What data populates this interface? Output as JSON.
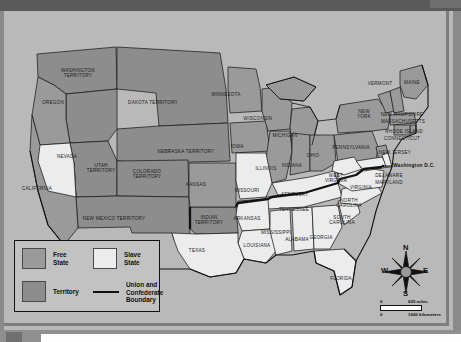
{
  "window": {
    "chrome_color": "#5a5a5a",
    "canvas_color": "#b9b9b9"
  },
  "map": {
    "title": "United States 1861 Free States Slave States and Territories",
    "colors": {
      "free_state": "#9a9a9a",
      "slave_state": "#ececec",
      "territory": "#8d8d8d",
      "boundary": "#111111",
      "outline": "#1b1b1b",
      "background": "#b9b9b9"
    },
    "regions": [
      {
        "name": "WASHINGTON TERRITORY",
        "lines": [
          "WASHINGTON",
          "TERRITORY"
        ],
        "x": 74,
        "y": 62,
        "fill": "territory"
      },
      {
        "name": "OREGON",
        "lines": [
          "OREGON"
        ],
        "x": 49,
        "y": 92,
        "fill": "free_state"
      },
      {
        "name": "DAKOTA TERRITORY",
        "lines": [
          "DAKOTA TERRITORY"
        ],
        "x": 149,
        "y": 92,
        "fill": "territory"
      },
      {
        "name": "MINNESOTA",
        "lines": [
          "MINNESOTA"
        ],
        "x": 222,
        "y": 84,
        "fill": "free_state"
      },
      {
        "name": "WISCONSIN",
        "lines": [
          "WISCONSIN"
        ],
        "x": 254,
        "y": 108,
        "fill": "free_state"
      },
      {
        "name": "MICHIGAN",
        "lines": [
          "MICHIGAN"
        ],
        "x": 281,
        "y": 125,
        "fill": "free_state"
      },
      {
        "name": "VERMONT",
        "lines": [
          "VERMONT"
        ],
        "x": 376,
        "y": 73,
        "fill": "free_state"
      },
      {
        "name": "MAINE",
        "lines": [
          "MAINE"
        ],
        "x": 408,
        "y": 72,
        "fill": "free_state"
      },
      {
        "name": "NEW HAMPSHIRE",
        "lines": [
          "NEW HAMPSHIRE"
        ],
        "x": 398,
        "y": 104,
        "fill": "free_state"
      },
      {
        "name": "MASSACHUSETTS",
        "lines": [
          "MASSACHUSETTS"
        ],
        "x": 399,
        "y": 111,
        "fill": "free_state"
      },
      {
        "name": "NEW YORK",
        "lines": [
          "NEW",
          "YORK"
        ],
        "x": 360,
        "y": 103,
        "fill": "free_state"
      },
      {
        "name": "RHODE ISLAND",
        "lines": [
          "RHODE ISLAND"
        ],
        "x": 400,
        "y": 121,
        "fill": "free_state"
      },
      {
        "name": "CONNECTICUT",
        "lines": [
          "CONNECTICUT"
        ],
        "x": 398,
        "y": 128,
        "fill": "free_state"
      },
      {
        "name": "PENNSYLVANIA",
        "lines": [
          "PENNSYLVANIA"
        ],
        "x": 347,
        "y": 137,
        "fill": "free_state"
      },
      {
        "name": "NEW JERSEY",
        "lines": [
          "NEW JERSEY"
        ],
        "x": 391,
        "y": 142,
        "fill": "free_state"
      },
      {
        "name": "OHIO",
        "lines": [
          "OHIO"
        ],
        "x": 309,
        "y": 145,
        "fill": "free_state"
      },
      {
        "name": "INDIANA",
        "lines": [
          "INDIANA"
        ],
        "x": 288,
        "y": 155,
        "fill": "free_state"
      },
      {
        "name": "ILLINOIS",
        "lines": [
          "ILLINOIS"
        ],
        "x": 262,
        "y": 158,
        "fill": "free_state"
      },
      {
        "name": "IOWA",
        "lines": [
          "IOWA"
        ],
        "x": 233,
        "y": 136,
        "fill": "free_state"
      },
      {
        "name": "NEBRASKA TERRITORY",
        "lines": [
          "NEBRASKA TERRITORY"
        ],
        "x": 182,
        "y": 141,
        "fill": "territory"
      },
      {
        "name": "KANSAS",
        "lines": [
          "KANSAS"
        ],
        "x": 192,
        "y": 174,
        "fill": "free_state"
      },
      {
        "name": "COLORADO TERRITORY",
        "lines": [
          "COLORADO",
          "TERRITORY"
        ],
        "x": 143,
        "y": 163,
        "fill": "territory"
      },
      {
        "name": "UTAH TERRITORY",
        "lines": [
          "UTAH",
          "TERRITORY"
        ],
        "x": 97,
        "y": 157,
        "fill": "territory"
      },
      {
        "name": "NEVADA",
        "lines": [
          "NEVADA"
        ],
        "x": 63,
        "y": 146,
        "fill": "slave_state"
      },
      {
        "name": "CALIFORNIA",
        "lines": [
          "CALIFORNIA"
        ],
        "x": 33,
        "y": 178,
        "fill": "free_state"
      },
      {
        "name": "NEW MEXICO TERRITORY",
        "lines": [
          "NEW MEXICO TERRITORY"
        ],
        "x": 110,
        "y": 208,
        "fill": "territory"
      },
      {
        "name": "INDIAN TERRITORY",
        "lines": [
          "INDIAN",
          "TERRITORY"
        ],
        "x": 205,
        "y": 209,
        "fill": "territory"
      },
      {
        "name": "TEXAS",
        "lines": [
          "TEXAS"
        ],
        "x": 193,
        "y": 240,
        "fill": "slave_state"
      },
      {
        "name": "MISSOURI",
        "lines": [
          "MISSOURI"
        ],
        "x": 243,
        "y": 180,
        "fill": "slave_state"
      },
      {
        "name": "ARKANSAS",
        "lines": [
          "ARKANSAS"
        ],
        "x": 243,
        "y": 208,
        "fill": "slave_state"
      },
      {
        "name": "LOUISIANA",
        "lines": [
          "LOUISIANA"
        ],
        "x": 253,
        "y": 235,
        "fill": "slave_state"
      },
      {
        "name": "MISSISSIPPI",
        "lines": [
          "MISSISSIPPI"
        ],
        "x": 272,
        "y": 222,
        "fill": "slave_state"
      },
      {
        "name": "ALABAMA",
        "lines": [
          "ALABAMA"
        ],
        "x": 293,
        "y": 229,
        "fill": "slave_state"
      },
      {
        "name": "GEORGIA",
        "lines": [
          "GEORGIA"
        ],
        "x": 317,
        "y": 227,
        "fill": "slave_state"
      },
      {
        "name": "FLORIDA",
        "lines": [
          "FLORIDA"
        ],
        "x": 337,
        "y": 268,
        "fill": "slave_state"
      },
      {
        "name": "TENNESSEE",
        "lines": [
          "TENNESSEE"
        ],
        "x": 290,
        "y": 199,
        "fill": "slave_state"
      },
      {
        "name": "KENTUCKY",
        "lines": [
          "KENTUCKY"
        ],
        "x": 291,
        "y": 184,
        "fill": "slave_state"
      },
      {
        "name": "SOUTH CAROLINA",
        "lines": [
          "SOUTH",
          "CAROLINA"
        ],
        "x": 338,
        "y": 209,
        "fill": "slave_state"
      },
      {
        "name": "NORTH CAROLINA",
        "lines": [
          "NORTH",
          "CAROLINA"
        ],
        "x": 345,
        "y": 192,
        "fill": "slave_state"
      },
      {
        "name": "VIRGINIA",
        "lines": [
          "VIRGINIA"
        ],
        "x": 357,
        "y": 177,
        "fill": "slave_state"
      },
      {
        "name": "WEST VIRGINIA",
        "lines": [
          "WEST",
          "VIRGINIA"
        ],
        "x": 332,
        "y": 167,
        "fill": "slave_state"
      },
      {
        "name": "MARYLAND",
        "lines": [
          "MARYLAND"
        ],
        "x": 385,
        "y": 172,
        "fill": "slave_state"
      },
      {
        "name": "DELAWARE",
        "lines": [
          "DELAWARE"
        ],
        "x": 385,
        "y": 165,
        "fill": "slave_state"
      }
    ],
    "callouts": [
      {
        "name": "washington-dc",
        "label": "Washington D.C.",
        "x": 389,
        "y": 155
      }
    ]
  },
  "legend": {
    "items": [
      {
        "key": "free-state",
        "label": "Free\nState",
        "line1": "Free",
        "line2": "State",
        "swatch": "free"
      },
      {
        "key": "slave-state",
        "label": "Slave\nState",
        "line1": "Slave",
        "line2": "State",
        "swatch": "slave"
      },
      {
        "key": "territory",
        "label": "Territory",
        "line1": "Territory",
        "line2": "",
        "swatch": "terr"
      },
      {
        "key": "boundary",
        "label": "Union and Confederate Boundary",
        "line1": "Union and",
        "line2": "Confederate",
        "line3": "Boundary",
        "swatch": "line"
      }
    ]
  },
  "compass": {
    "north": "N",
    "south": "S",
    "east": "E",
    "west": "W"
  },
  "scale": {
    "miles_zero": "0",
    "miles_value": "625 miles",
    "km_zero": "0",
    "km_value": "1000 kilometers"
  }
}
